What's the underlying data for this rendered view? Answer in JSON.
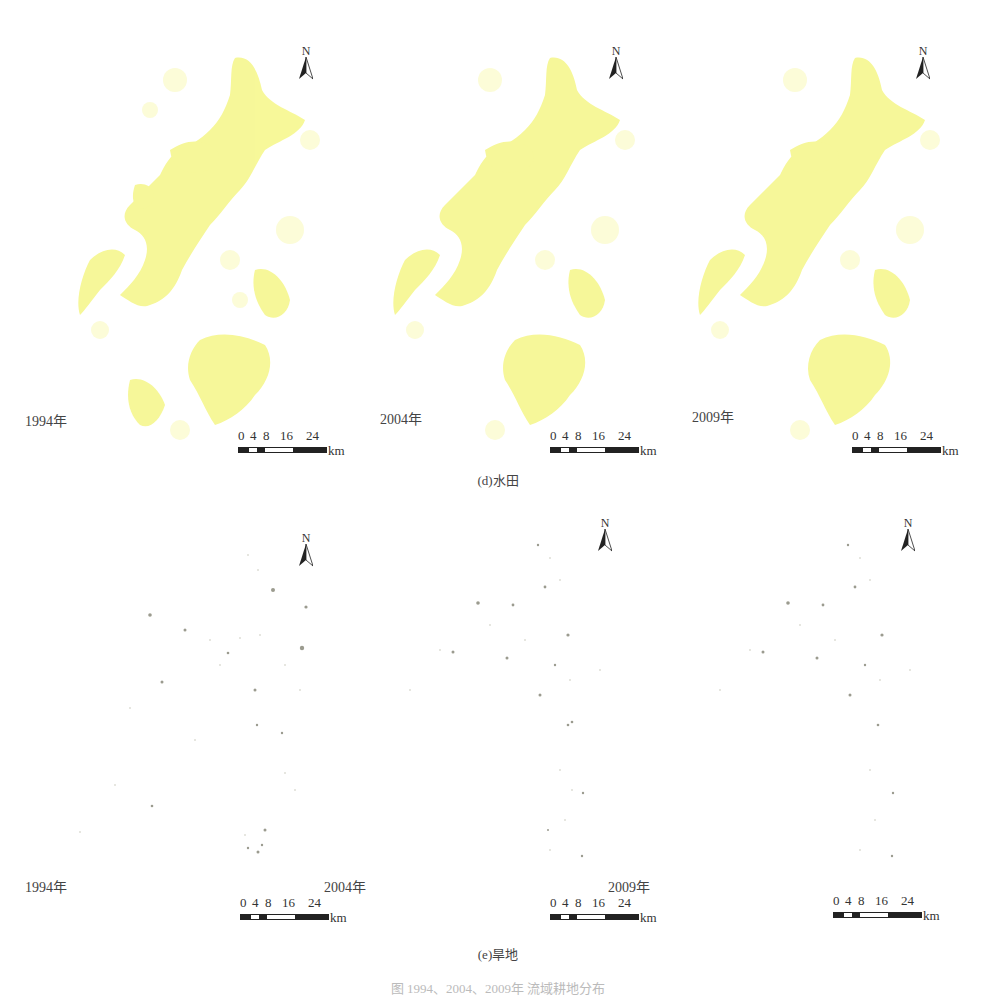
{
  "figure": {
    "caption_bottom": "图 1994、2004、2009年 流域耕地分布"
  },
  "rows": [
    {
      "caption": "(d)水田",
      "land_type": "paddy field",
      "fill_color": "#f5f58a",
      "panels": [
        {
          "year_label": "1994年",
          "north": "N"
        },
        {
          "year_label": "2004年",
          "north": "N"
        },
        {
          "year_label": "2009年",
          "north": "N"
        }
      ]
    },
    {
      "caption": "(e)旱地",
      "land_type": "dry land",
      "fill_color": "#8a8a7a",
      "panels": [
        {
          "year_label": "1994年",
          "north": "N"
        },
        {
          "year_label": "2004年",
          "north": "N"
        },
        {
          "year_label": "2009年",
          "north": "N"
        }
      ]
    }
  ],
  "scalebar": {
    "ticks": [
      "0",
      "4",
      "8",
      "16",
      "24"
    ],
    "unit": "km"
  }
}
